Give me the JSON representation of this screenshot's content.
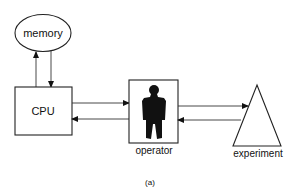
{
  "diagram": {
    "caption": "(a)",
    "nodes": [
      {
        "id": "memory",
        "label": "memory",
        "shape": "ellipse"
      },
      {
        "id": "cpu",
        "label": "CPU",
        "shape": "rectangle"
      },
      {
        "id": "operator",
        "label": "operator",
        "shape": "rectangle-with-person-silhouette"
      },
      {
        "id": "experiment",
        "label": "experiment",
        "shape": "triangle"
      }
    ],
    "edges": [
      {
        "from": "cpu",
        "to": "memory"
      },
      {
        "from": "memory",
        "to": "cpu"
      },
      {
        "from": "cpu",
        "to": "operator"
      },
      {
        "from": "operator",
        "to": "cpu"
      },
      {
        "from": "operator",
        "to": "experiment"
      },
      {
        "from": "experiment",
        "to": "operator"
      }
    ],
    "colors": {
      "stroke": "#222222",
      "fill": "#ffffff",
      "silhouette": "#111111"
    }
  }
}
